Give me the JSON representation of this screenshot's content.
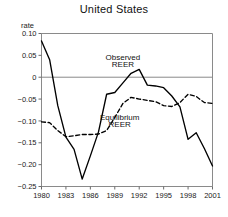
{
  "chart_data": {
    "type": "line",
    "title": "United States",
    "xlabel": "",
    "ylabel": "rate",
    "xlim": [
      1980,
      2001
    ],
    "ylim": [
      -0.25,
      0.1
    ],
    "grid": false,
    "legend_position": "inline-annotations",
    "xticks": [
      "1980",
      "1983",
      "1986",
      "1989",
      "1992",
      "1995",
      "1998",
      "2001"
    ],
    "xtick_values": [
      1980,
      1983,
      1986,
      1989,
      1992,
      1995,
      1998,
      2001
    ],
    "yticks": [
      "0.10",
      "0.05",
      "0",
      "-0.05",
      "-0.10",
      "-0.15",
      "-0.20",
      "-0.25"
    ],
    "ytick_values": [
      0.1,
      0.05,
      0,
      -0.05,
      -0.1,
      -0.15,
      -0.2,
      -0.25
    ],
    "zero_line": 0,
    "annotations": [
      {
        "text": "Observed",
        "x": 1990.0,
        "y": 0.039
      },
      {
        "text": "REER",
        "x": 1990.0,
        "y": 0.024
      },
      {
        "text": "Equilibrium",
        "x": 1989.6,
        "y": -0.098
      },
      {
        "text": "REER",
        "x": 1989.6,
        "y": -0.113
      }
    ],
    "x": [
      1980,
      1981,
      1982,
      1983,
      1984,
      1985,
      1986,
      1987,
      1988,
      1989,
      1990,
      1991,
      1992,
      1993,
      1994,
      1995,
      1996,
      1997,
      1998,
      1999,
      2000,
      2001
    ],
    "series": [
      {
        "name": "Observed REER",
        "style": "solid",
        "color": "#000000",
        "values": [
          0.083,
          0.04,
          -0.065,
          -0.137,
          -0.165,
          -0.233,
          -0.18,
          -0.125,
          -0.039,
          -0.035,
          -0.013,
          0.009,
          0.018,
          -0.018,
          -0.02,
          -0.024,
          -0.043,
          -0.068,
          -0.142,
          -0.127,
          -0.163,
          -0.203
        ]
      },
      {
        "name": "Equilibrium REER",
        "style": "dashed",
        "color": "#000000",
        "values": [
          -0.102,
          -0.104,
          -0.122,
          -0.136,
          -0.134,
          -0.131,
          -0.131,
          -0.13,
          -0.122,
          -0.092,
          -0.06,
          -0.046,
          -0.05,
          -0.053,
          -0.056,
          -0.065,
          -0.067,
          -0.058,
          -0.039,
          -0.044,
          -0.058,
          -0.06
        ]
      }
    ]
  }
}
